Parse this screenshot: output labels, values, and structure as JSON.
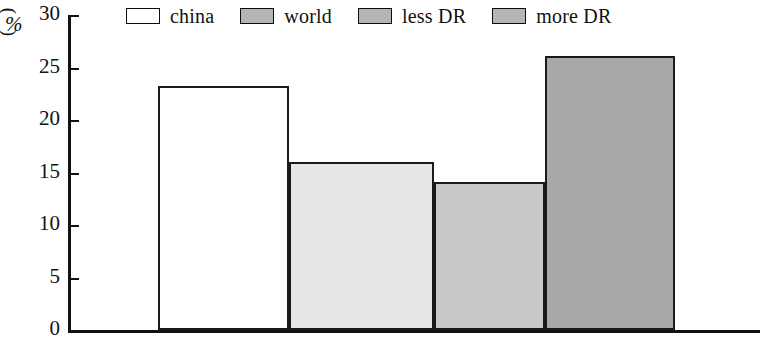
{
  "chart_data": {
    "type": "bar",
    "title": "",
    "subtitle": "",
    "xlabel": "",
    "ylabel": "(%)",
    "ylim": [
      0,
      30
    ],
    "yticks": [
      0,
      5,
      10,
      15,
      20,
      25,
      30
    ],
    "ytick_labels": [
      "0",
      "5",
      "10",
      "15",
      "20",
      "25",
      "30"
    ],
    "grid": false,
    "legend_position": "top",
    "categories": [
      "china",
      "world",
      "less DR",
      "more DR"
    ],
    "values": [
      23.2,
      16.0,
      14.1,
      26.1
    ],
    "series": [
      {
        "name": "percentage",
        "values": [
          23.2,
          16.0,
          14.1,
          26.1
        ]
      }
    ],
    "bar_colors": [
      "#ffffff",
      "#e7e7e7",
      "#c9c9c9",
      "#a9a9a9"
    ],
    "bar_edge_color": "#1a1a1a",
    "annotations": []
  },
  "legend": {
    "entries": [
      {
        "label": "china",
        "color": "#ffffff"
      },
      {
        "label": "world",
        "color": "#b5b5b5"
      },
      {
        "label": "less DR",
        "color": "#b5b5b5"
      },
      {
        "label": "more DR",
        "color": "#b5b5b5"
      }
    ]
  },
  "axis": {
    "ylabel_symbol": "%",
    "paren_open": "(",
    "paren_close": ")"
  }
}
